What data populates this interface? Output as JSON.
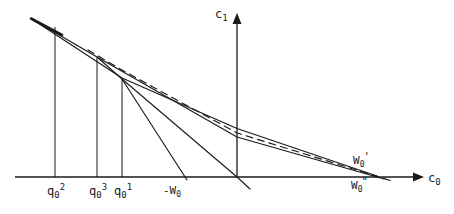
{
  "figure": {
    "type": "economics-budget-line-diagram",
    "width": 454,
    "height": 214,
    "background": "#ffffff",
    "ink_color": "#1a1a1a"
  },
  "axes": {
    "x_axis": {
      "label": "c",
      "label_sub": "0",
      "y_pixel": 177,
      "x_start": 15,
      "x_end": 420,
      "arrow": true
    },
    "y_axis": {
      "label": "c",
      "label_sub": "1",
      "x_pixel": 237,
      "y_bottom": 177,
      "y_top": 18,
      "arrow": true
    }
  },
  "tick_labels": [
    {
      "name": "q0-2",
      "base": "q",
      "sub": "0",
      "sup": "2",
      "x": 55
    },
    {
      "name": "q0-3",
      "base": "q",
      "sub": "0",
      "sup": "3",
      "x": 97
    },
    {
      "name": "q0-1",
      "base": "q",
      "sub": "0",
      "sup": "1",
      "x": 122
    }
  ],
  "point_labels": [
    {
      "name": "minus-w0",
      "text": "-W",
      "sub": "0",
      "prime": "",
      "x": 160,
      "y": 183
    },
    {
      "name": "w0-prime",
      "text": "W",
      "sub": "0",
      "prime": "'",
      "x": 352,
      "y": 157
    },
    {
      "name": "w0-double-prime",
      "text": "W",
      "sub": "0",
      "prime": "\"",
      "x": 352,
      "y": 180
    }
  ],
  "vertical_droplines": [
    {
      "name": "dropline-q0-2",
      "x": 55,
      "y_top": 27,
      "y_bottom": 177
    },
    {
      "name": "dropline-q0-3",
      "x": 97,
      "y_top": 57,
      "y_bottom": 177
    },
    {
      "name": "dropline-q0-1",
      "x": 122,
      "y_top": 78,
      "y_bottom": 177
    }
  ],
  "curves": [
    {
      "name": "budget-line-upper-solid",
      "style": "solid",
      "points": "32,19 97,57 237,137 382,178"
    },
    {
      "name": "budget-line-from-q0-2-to-w0-prime",
      "style": "solid",
      "points": "32,19 122,78 237,128 375,176"
    },
    {
      "name": "budget-line-dashed",
      "style": "dashed",
      "points": "90,52 237,133 390,180"
    },
    {
      "name": "budget-line-steep-to-minus-w0",
      "style": "solid",
      "points": "97,57 122,78 187,180"
    },
    {
      "name": "budget-line-medium-steep",
      "style": "solid",
      "points": "122,78 237,177 248,188"
    }
  ],
  "annotations": {
    "origin_blob": {
      "name": "line-bundle-origin",
      "x": 32,
      "y": 19
    },
    "kink_points": [
      {
        "name": "kink-q0-3",
        "x": 97,
        "y": 57
      },
      {
        "name": "kink-q0-1",
        "x": 122,
        "y": 78
      }
    ]
  }
}
